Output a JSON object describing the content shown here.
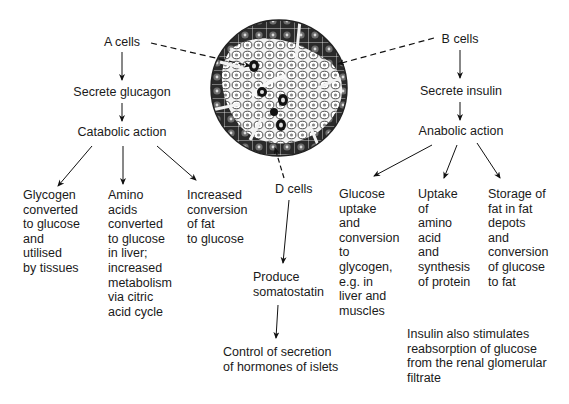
{
  "diagram": {
    "title_cut": "",
    "micrograph": {
      "label": "islet-of-langerhans-micrograph",
      "center": [
        279,
        88
      ],
      "radius": 68
    },
    "a_branch": {
      "source": "A cells",
      "step1": "Secrete glucagon",
      "step2": "Catabolic action",
      "effects": [
        {
          "lines": [
            "Glycogen",
            "converted",
            "to glucose",
            "and",
            "utilised",
            "by tissues"
          ]
        },
        {
          "lines": [
            "Amino",
            "acids",
            "converted",
            "to glucose",
            "in liver;",
            "increased",
            "metabolism",
            "via citric",
            "acid cycle"
          ]
        },
        {
          "lines": [
            "Increased",
            "conversion",
            "of fat",
            "to glucose"
          ]
        }
      ]
    },
    "b_branch": {
      "source": "B cells",
      "step1": "Secrete insulin",
      "step2": "Anabolic action",
      "effects": [
        {
          "lines": [
            "Glucose",
            "uptake",
            "and",
            "conversion",
            "to",
            "glycogen,",
            "e.g. in",
            "liver and",
            "muscles"
          ]
        },
        {
          "lines": [
            "Uptake",
            "of",
            "amino",
            "acid",
            "and",
            "synthesis",
            "of protein"
          ]
        },
        {
          "lines": [
            "Storage of",
            "fat in fat",
            "depots",
            "and",
            "conversion",
            "of glucose",
            "to fat"
          ]
        }
      ],
      "note": [
        "Insulin also stimulates",
        "reabsorption of glucose",
        "from the renal glomerular",
        "filtrate"
      ]
    },
    "d_branch": {
      "source": "D cells",
      "step1": [
        "Produce",
        "somatostatin"
      ],
      "step2": [
        "Control of secretion",
        "of hormones of islets"
      ]
    }
  }
}
